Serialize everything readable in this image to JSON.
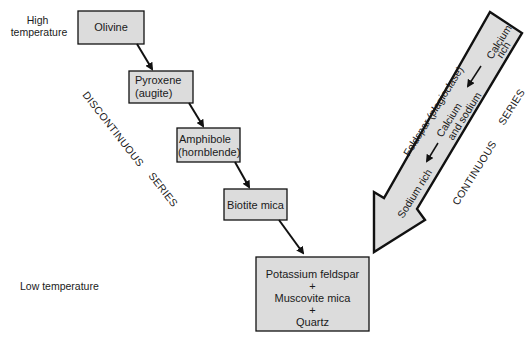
{
  "labels": {
    "high_temperature": [
      "High",
      "temperature"
    ],
    "low_temperature": "Low temperature",
    "discontinuous": "DISCONTINUOUS",
    "discontinuous_series": "SERIES",
    "continuous": "CONTINUOUS",
    "continuous_series": "SERIES"
  },
  "discontinuous_series": {
    "boxes": [
      {
        "lines": [
          "Olivine"
        ]
      },
      {
        "lines": [
          "Pyroxene",
          "(augite)"
        ]
      },
      {
        "lines": [
          "Amphibole",
          "(hornblende)"
        ]
      },
      {
        "lines": [
          "Biotite mica"
        ]
      }
    ]
  },
  "final_box": {
    "lines": [
      "Potassium feldspar",
      "+",
      "Muscovite mica",
      "+",
      "Quartz"
    ]
  },
  "continuous_series": {
    "arrow_label": "Feldspar (plagioclase)",
    "stages": [
      {
        "lines": [
          "Calcium",
          "rich"
        ]
      },
      {
        "lines": [
          "Calcium",
          "and sodium"
        ]
      },
      {
        "lines": [
          "Sodium rich"
        ]
      }
    ]
  },
  "colors": {
    "box_fill": "#dcdcdc",
    "arrow_fill": "#dedede",
    "stroke": "#111111"
  }
}
